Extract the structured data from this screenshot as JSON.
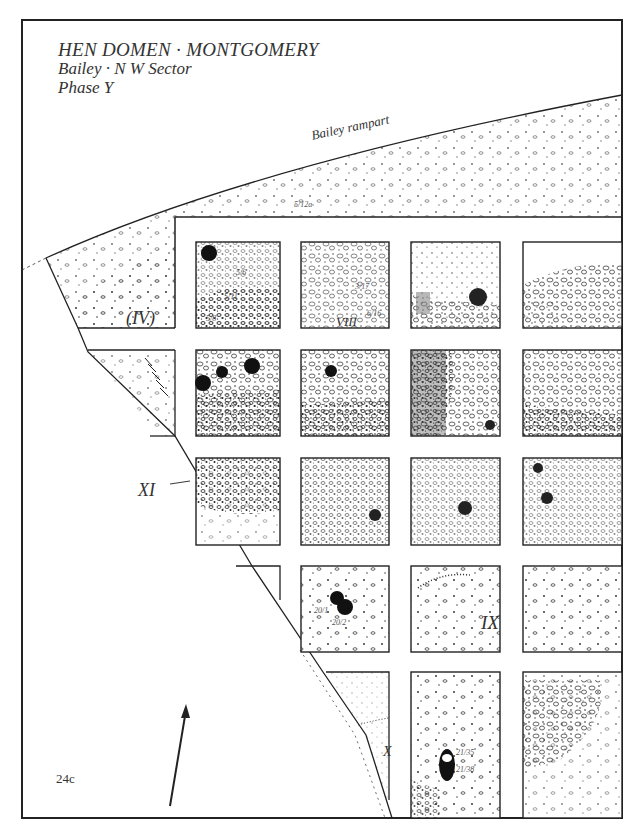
{
  "title": {
    "line1": "HEN DOMEN · MONTGOMERY",
    "line2": "Bailey · N W  Sector",
    "line3": "Phase Y"
  },
  "annotations": {
    "rampart": "Bailey  rampart",
    "figure_number": "24c"
  },
  "area_labels": {
    "IV": "(IV)",
    "VIII": "VIII",
    "XI": "XI",
    "IX": "IX",
    "X": "X"
  },
  "context_numbers": {
    "c5_16": "5/6",
    "c5_11": "5/11",
    "c5_8": "5/8",
    "c5_12a": "5/12a",
    "c3_17": "3/17",
    "c6_16": "6/16",
    "c20_1": "20/1",
    "c20_2": "20/2",
    "c21_35": "21/35",
    "c21_38": "21/38"
  },
  "grid": {
    "columns": 4,
    "rows": 5,
    "description": "Excavation grid of planned boxes showing stones, post-holes and features"
  },
  "north_arrow": {
    "icon": "north-arrow-icon"
  },
  "colors": {
    "ink": "#222222",
    "paper": "#ffffff"
  }
}
